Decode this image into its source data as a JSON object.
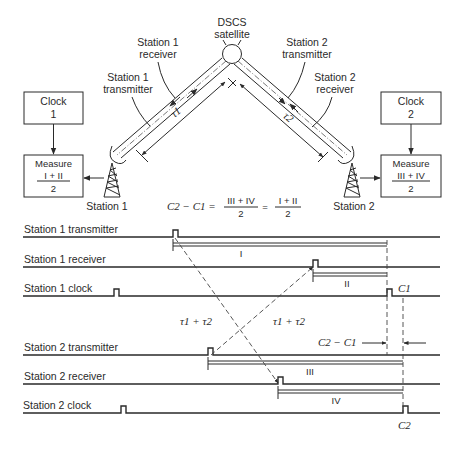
{
  "satellite": {
    "label_line1": "DSCS",
    "label_line2": "satellite"
  },
  "station1": {
    "name": "Station 1",
    "receiver_label_line1": "Station 1",
    "receiver_label_line2": "receiver",
    "transmitter_label_line1": "Station 1",
    "transmitter_label_line2": "transmitter",
    "path_delay": "τ1",
    "clock_box": {
      "line1": "Clock",
      "line2": "1"
    },
    "measure_box": {
      "line1": "Measure",
      "numerator": "I + II",
      "denominator": "2"
    }
  },
  "station2": {
    "name": "Station 2",
    "transmitter_label_line1": "Station 2",
    "transmitter_label_line2": "transmitter",
    "receiver_label_line1": "Station 2",
    "receiver_label_line2": "receiver",
    "path_delay": "τ2",
    "clock_box": {
      "line1": "Clock",
      "line2": "2"
    },
    "measure_box": {
      "line1": "Measure",
      "numerator": "III + IV",
      "denominator": "2"
    }
  },
  "equation": {
    "lhs": "C2 − C1 =",
    "frac1_num": "III + IV",
    "frac1_den": "2",
    "eq2": "=",
    "frac2_num": "I + II",
    "frac2_den": "2"
  },
  "timing": {
    "rows": [
      {
        "label": "Station 1 transmitter"
      },
      {
        "label": "Station 1 receiver"
      },
      {
        "label": "Station 1 clock"
      },
      {
        "label": "Station 2 transmitter"
      },
      {
        "label": "Station 2 receiver"
      },
      {
        "label": "Station 2 clock"
      }
    ],
    "intervals": {
      "i": "I",
      "ii": "II",
      "iii": "III",
      "iv": "IV"
    },
    "delay_left": "τ1 + τ2",
    "delay_right": "τ1 + τ2",
    "c1_label": "C1",
    "c2_label": "C2",
    "offset_label": "C2 − C1"
  }
}
